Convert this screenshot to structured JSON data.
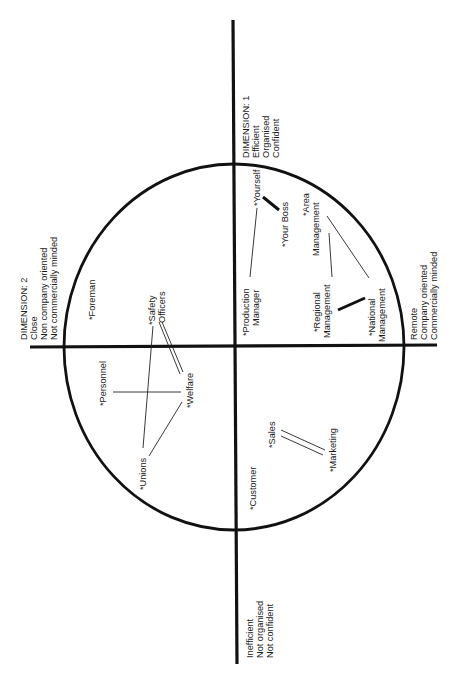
{
  "diagram": {
    "type": "perceptual-map",
    "orientation": "rotated-90-ccw",
    "dimensions": {
      "dim1_positive": {
        "lines": [
          "DIMENSION: 1",
          "Efficient",
          "Organised",
          "Confident"
        ]
      },
      "dim1_negative": {
        "lines": [
          "Inefficient",
          "Not organised",
          "Not confident"
        ]
      },
      "dim2_positive": {
        "lines": [
          "DIMENSION: 2",
          "Close",
          "Non company oriented",
          "Not commercially minded"
        ]
      },
      "dim2_negative": {
        "lines": [
          "Remote",
          "Company oriented",
          "Commercially minded"
        ]
      }
    },
    "nodes": {
      "yourself": {
        "lines": [
          "*Yourself"
        ]
      },
      "your_boss": {
        "lines": [
          "*Your Boss"
        ]
      },
      "production_manager": {
        "lines": [
          "*Production",
          "Manager"
        ]
      },
      "area_management": {
        "lines": [
          "*Area",
          "Management"
        ]
      },
      "regional_management": {
        "lines": [
          "*Regional",
          "Management"
        ]
      },
      "national_management": {
        "lines": [
          "*National",
          "Management"
        ]
      },
      "foreman": {
        "lines": [
          "*Foreman"
        ]
      },
      "safety_officers": {
        "lines": [
          "*Safety",
          "Officers"
        ]
      },
      "personnel": {
        "lines": [
          "*Personnel"
        ]
      },
      "welfare": {
        "lines": [
          "*Welfare"
        ]
      },
      "unions": {
        "lines": [
          "*Unions"
        ]
      },
      "sales": {
        "lines": [
          "*Sales"
        ]
      },
      "marketing": {
        "lines": [
          "*Marketing"
        ]
      },
      "customer": {
        "lines": [
          "*Customer"
        ]
      }
    },
    "links": [
      {
        "from": "Yourself",
        "to": "Your Boss",
        "style": "thick"
      },
      {
        "from": "Yourself",
        "to": "Production Manager",
        "style": "thin"
      },
      {
        "from": "Area Management",
        "to": "Regional Management",
        "style": "thin"
      },
      {
        "from": "Area Management",
        "to": "National Management",
        "style": "thin"
      },
      {
        "from": "Regional Management",
        "to": "National Management",
        "style": "thick"
      },
      {
        "from": "Safety Officers",
        "to": "Welfare",
        "style": "double"
      },
      {
        "from": "Safety Officers",
        "to": "Unions",
        "style": "thin"
      },
      {
        "from": "Personnel",
        "to": "Welfare",
        "style": "thin"
      },
      {
        "from": "Welfare",
        "to": "Unions",
        "style": "thin"
      },
      {
        "from": "Sales",
        "to": "Marketing",
        "style": "double"
      }
    ],
    "colors": {
      "ink": "#111111",
      "background": "#ffffff"
    }
  }
}
